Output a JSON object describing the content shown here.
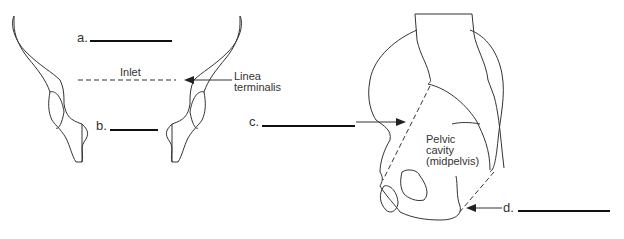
{
  "figure": {
    "left_view": {
      "labels": {
        "a": "a.",
        "b": "b.",
        "inlet": "Inlet",
        "linea_line1": "Linea",
        "linea_line2": "terminalis"
      }
    },
    "right_view": {
      "labels": {
        "c": "c.",
        "d": "d.",
        "cavity_line1": "Pelvic",
        "cavity_line2": "cavity",
        "cavity_line3": "(midpelvis)"
      }
    },
    "colors": {
      "stroke": "#333333",
      "blank": "#111111",
      "background": "#ffffff"
    }
  }
}
